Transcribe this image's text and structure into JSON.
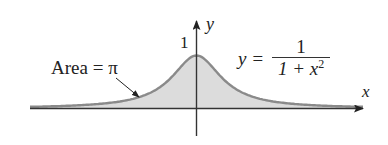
{
  "diagram": {
    "function_label": {
      "lhs": "y =",
      "numerator": "1",
      "denominator_base": "1 + x",
      "denominator_exp": "2"
    },
    "area_label": "Area = π",
    "peak_label": "1",
    "axes": {
      "x_label": "x",
      "y_label": "y"
    },
    "colors": {
      "fill": "#dcdcdc",
      "curve": "#8a8a8a",
      "axis": "#222222",
      "text": "#222222"
    }
  },
  "chart_data": {
    "type": "area",
    "title": "",
    "function": "y = 1/(1+x^2)",
    "xlabel": "x",
    "ylabel": "y",
    "annotations": [
      "Area = π",
      "1"
    ],
    "x": [
      -5.5,
      -4,
      -3,
      -2,
      -1,
      0,
      1,
      2,
      3,
      4,
      5.5
    ],
    "values": [
      0.032,
      0.059,
      0.1,
      0.2,
      0.5,
      1,
      0.5,
      0.2,
      0.1,
      0.059,
      0.032
    ],
    "ylim": [
      0,
      1.2
    ],
    "grid": false
  }
}
